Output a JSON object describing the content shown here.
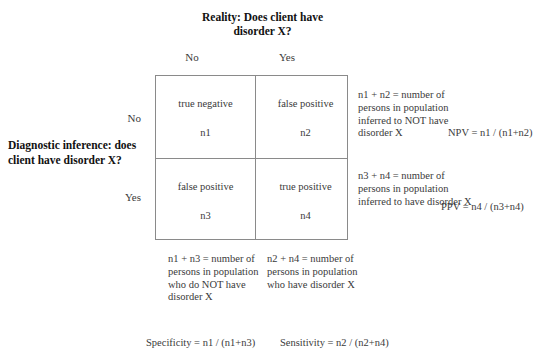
{
  "headings": {
    "reality_title": "Reality: Does client have disorder X?",
    "inference_title": "Diagnostic inference: does client have disorder X?"
  },
  "matrix": {
    "column_headers": [
      "No",
      "Yes"
    ],
    "row_headers": [
      "No",
      "Yes"
    ],
    "cells": [
      {
        "id": "true-negative",
        "label": "true negative",
        "count": "n1"
      },
      {
        "id": "false-positive-top",
        "label": "false positive",
        "count": "n2"
      },
      {
        "id": "false-positive-bot",
        "label": "false positive",
        "count": "n3"
      },
      {
        "id": "true-positive",
        "label": "true positive",
        "count": "n4"
      }
    ]
  },
  "annotations": {
    "npv_note": "n1 + n2 = number of persons in population inferred to NOT have disorder X",
    "ppv_note": "n3 + n4 = number of persons in population inferred to have disorder X",
    "specificity_note": "n1 + n3 = number of persons in population who do NOT have disorder X",
    "sensitivity_note": "n2 + n4 = number of persons in population who have disorder X"
  },
  "formulas": {
    "npv": "NPV = n1 / (n1+n2)",
    "ppv": "PPV = n4 / (n3+n4)",
    "specificity": "Specificity = n1 / (n1+n3)",
    "sensitivity": "Sensitivity = n2 / (n2+n4)"
  },
  "colors": {
    "border": "#8a8a8a",
    "text": "#3a3a3a",
    "heading": "#111111",
    "background": "#ffffff"
  }
}
